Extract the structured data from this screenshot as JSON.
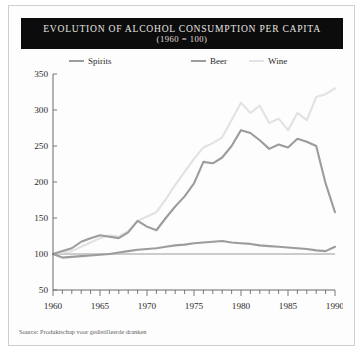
{
  "card": {
    "source_note": "Source: Produktschap voor gedistilleerde dranken"
  },
  "header": {
    "title": "EVOLUTION OF ALCOHOL CONSUMPTION PER CAPITA",
    "subtitle": "(1960 = 100)"
  },
  "colors": {
    "title_bar_bg": "#0c0c0c",
    "title_text": "#e8e6e2",
    "spirits": "#9c9c9c",
    "beer": "#9c9c9c",
    "wine": "#e2e2e2",
    "axis": "#6b6b6b",
    "refline": "#9a9a9a",
    "card_bg": "#fdfdfd",
    "card_border": "#cfcfcf"
  },
  "chart_data": {
    "type": "line",
    "title": "EVOLUTION OF ALCOHOL CONSUMPTION PER CAPITA",
    "subtitle": "(1960 = 100)",
    "xlabel": "",
    "ylabel": "",
    "xlim": [
      1960,
      1990
    ],
    "ylim": [
      50,
      350
    ],
    "yticks": [
      50,
      100,
      150,
      200,
      250,
      300,
      350
    ],
    "ytick_labels": [
      "50",
      "100",
      "150",
      "200",
      "250",
      "300",
      "350"
    ],
    "xticks": [
      1960,
      1965,
      1970,
      1975,
      1980,
      1985,
      1990
    ],
    "xtick_labels": [
      "1960",
      "1965",
      "1970",
      "1975",
      "1980",
      "1985",
      "1990"
    ],
    "xtick_minor_step": 1,
    "grid": false,
    "legend_position": "top",
    "reference_line": {
      "y": 100,
      "label": "index base 1960 = 100"
    },
    "x": [
      1960,
      1961,
      1962,
      1963,
      1964,
      1965,
      1966,
      1967,
      1968,
      1969,
      1970,
      1971,
      1972,
      1973,
      1974,
      1975,
      1976,
      1977,
      1978,
      1979,
      1980,
      1981,
      1982,
      1983,
      1984,
      1985,
      1986,
      1987,
      1988,
      1989,
      1990
    ],
    "series": [
      {
        "name": "Spirits",
        "color": "#9c9c9c",
        "values": [
          100,
          104,
          108,
          117,
          122,
          126,
          124,
          122,
          130,
          146,
          138,
          133,
          150,
          166,
          180,
          198,
          228,
          226,
          234,
          250,
          272,
          268,
          258,
          246,
          252,
          248,
          260,
          256,
          250,
          198,
          158
        ]
      },
      {
        "name": "Beer",
        "color": "#9c9c9c",
        "values": [
          100,
          95,
          96,
          97,
          98,
          99,
          100,
          102,
          104,
          106,
          107,
          108,
          110,
          112,
          113,
          115,
          116,
          117,
          118,
          116,
          115,
          114,
          112,
          111,
          110,
          109,
          108,
          107,
          105,
          104,
          110
        ]
      },
      {
        "name": "Wine",
        "color": "#e2e2e2",
        "values": [
          100,
          102,
          104,
          110,
          116,
          122,
          126,
          124,
          132,
          146,
          152,
          158,
          176,
          196,
          214,
          232,
          248,
          254,
          262,
          286,
          310,
          296,
          306,
          282,
          288,
          272,
          296,
          286,
          318,
          322,
          330
        ]
      }
    ]
  },
  "legend": {
    "items": [
      {
        "label": "Spirits",
        "color": "#9c9c9c"
      },
      {
        "label": "Beer",
        "color": "#9c9c9c"
      },
      {
        "label": "Wine",
        "color": "#e2e2e2"
      }
    ]
  }
}
